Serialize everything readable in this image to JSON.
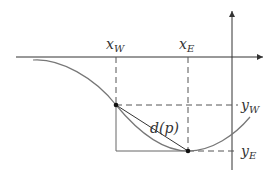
{
  "diagram": {
    "labels": {
      "x_w": {
        "main": "x",
        "sub": "W"
      },
      "x_e": {
        "main": "x",
        "sub": "E"
      },
      "y_w": {
        "main": "y",
        "sub": "W"
      },
      "y_e": {
        "main": "y",
        "sub": "E"
      },
      "distance": "d(p)"
    },
    "colors": {
      "axis": "#333333",
      "curve": "#777777",
      "dashed": "#555555",
      "point": "#111111"
    }
  }
}
